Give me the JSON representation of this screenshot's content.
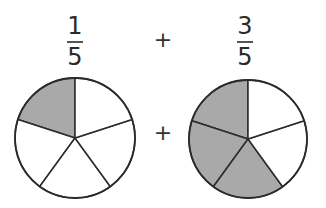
{
  "equation": {
    "left_fraction": {
      "numerator": "1",
      "denominator": "5"
    },
    "operator_top": "+",
    "right_fraction": {
      "numerator": "3",
      "denominator": "5"
    },
    "operator_middle": "+"
  },
  "pies": [
    {
      "name": "one-fifth-pie",
      "segments": 5,
      "shaded": 1,
      "cx": 75,
      "cy": 138,
      "r": 60
    },
    {
      "name": "three-fifths-pie",
      "segments": 5,
      "shaded": 3,
      "cx": 248,
      "cy": 139,
      "r": 59
    }
  ],
  "colors": {
    "shade": "#a9a9a9",
    "stroke": "#2b2b2b",
    "background": "#ffffff"
  }
}
